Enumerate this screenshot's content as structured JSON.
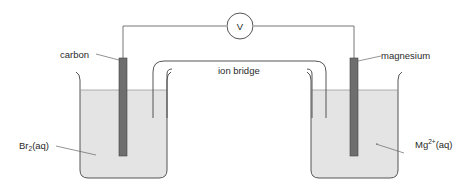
{
  "diagram": {
    "type": "electrochemical-cell",
    "meter": {
      "symbol": "V",
      "name": "voltmeter"
    },
    "labels": {
      "left_electrode": "carbon",
      "right_electrode": "magnesium",
      "bridge": "ion bridge",
      "left_solution_base": "Br",
      "left_solution_sub": "2",
      "left_solution_tail": "(aq)",
      "right_solution_base": "Mg",
      "right_solution_sup": "2+",
      "right_solution_tail": "(aq)"
    },
    "colors": {
      "liquid": "#e4e4e4",
      "electrode": "#6e6e6e",
      "line": "#555555",
      "text": "#2a2a2a"
    }
  }
}
